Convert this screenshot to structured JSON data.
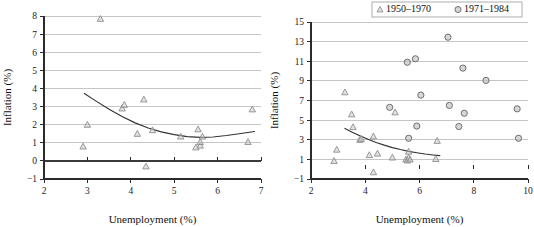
{
  "figure": {
    "panel_count": 2
  },
  "chart_data": [
    {
      "id": "left",
      "type": "scatter",
      "title": "",
      "xlabel": "Unemployment (%)",
      "ylabel": "Inflation (%)",
      "xlim": [
        2,
        7
      ],
      "ylim": [
        -1,
        8
      ],
      "xticks": [
        2,
        3,
        4,
        5,
        6,
        7
      ],
      "yticks": [
        -1,
        0,
        1,
        2,
        3,
        4,
        5,
        6,
        7,
        8
      ],
      "grid": true,
      "legend": false,
      "series": [
        {
          "name": "1950-1970",
          "marker": "triangle",
          "points": [
            [
              2.9,
              0.8
            ],
            [
              3.0,
              2.0
            ],
            [
              3.3,
              7.85
            ],
            [
              3.8,
              2.9
            ],
            [
              3.85,
              3.1
            ],
            [
              4.15,
              1.5
            ],
            [
              4.3,
              3.4
            ],
            [
              4.35,
              -0.3
            ],
            [
              4.5,
              1.7
            ],
            [
              5.15,
              1.35
            ],
            [
              5.5,
              0.75
            ],
            [
              5.55,
              1.75
            ],
            [
              5.6,
              0.85
            ],
            [
              5.6,
              1.05
            ],
            [
              5.65,
              1.35
            ],
            [
              6.7,
              1.05
            ],
            [
              6.8,
              2.85
            ]
          ]
        }
      ],
      "trend": {
        "name": "quadratic-fit",
        "points": [
          [
            2.93,
            3.72
          ],
          [
            3.2,
            3.3
          ],
          [
            3.5,
            2.85
          ],
          [
            3.8,
            2.45
          ],
          [
            4.1,
            2.1
          ],
          [
            4.4,
            1.82
          ],
          [
            4.7,
            1.6
          ],
          [
            5.0,
            1.45
          ],
          [
            5.3,
            1.34
          ],
          [
            5.6,
            1.3
          ],
          [
            5.9,
            1.32
          ],
          [
            6.2,
            1.4
          ],
          [
            6.5,
            1.5
          ],
          [
            6.85,
            1.62
          ]
        ]
      }
    },
    {
      "id": "right",
      "type": "scatter",
      "title": "",
      "xlabel": "Unemployment (%)",
      "ylabel": "Inflation (%)",
      "xlim": [
        2,
        10
      ],
      "ylim": [
        -1,
        15
      ],
      "xticks": [
        2,
        4,
        6,
        8,
        10
      ],
      "yticks": [
        -1,
        1,
        3,
        5,
        7,
        9,
        11,
        13,
        15
      ],
      "grid": true,
      "legend": true,
      "legend_position": "top",
      "legend_entries": [
        {
          "label": "1950-1970",
          "marker": "triangle"
        },
        {
          "label": "1971-1984",
          "marker": "circle"
        }
      ],
      "series": [
        {
          "name": "1950-1970",
          "marker": "triangle",
          "points": [
            [
              2.85,
              0.85
            ],
            [
              2.95,
              2.0
            ],
            [
              3.25,
              7.85
            ],
            [
              3.5,
              5.6
            ],
            [
              3.55,
              4.3
            ],
            [
              3.8,
              3.0
            ],
            [
              3.85,
              3.1
            ],
            [
              4.15,
              1.45
            ],
            [
              4.3,
              3.35
            ],
            [
              4.3,
              -0.3
            ],
            [
              4.45,
              1.6
            ],
            [
              5.0,
              1.2
            ],
            [
              5.1,
              5.8
            ],
            [
              5.5,
              1.0
            ],
            [
              5.55,
              0.9
            ],
            [
              5.6,
              1.2
            ],
            [
              5.6,
              1.8
            ],
            [
              5.65,
              1.0
            ],
            [
              6.6,
              1.05
            ],
            [
              6.65,
              2.9
            ]
          ]
        },
        {
          "name": "1971-1984",
          "marker": "circle",
          "points": [
            [
              4.9,
              6.3
            ],
            [
              5.55,
              10.9
            ],
            [
              5.6,
              3.15
            ],
            [
              5.85,
              11.25
            ],
            [
              5.9,
              4.4
            ],
            [
              6.05,
              7.55
            ],
            [
              7.05,
              13.45
            ],
            [
              7.1,
              6.5
            ],
            [
              7.45,
              4.35
            ],
            [
              7.6,
              10.3
            ],
            [
              7.65,
              5.7
            ],
            [
              8.45,
              9.05
            ],
            [
              9.6,
              6.15
            ],
            [
              9.65,
              3.15
            ]
          ]
        }
      ],
      "trend": {
        "name": "decay-fit",
        "points": [
          [
            3.25,
            4.15
          ],
          [
            3.5,
            3.8
          ],
          [
            3.8,
            3.4
          ],
          [
            4.1,
            3.05
          ],
          [
            4.4,
            2.72
          ],
          [
            4.7,
            2.45
          ],
          [
            5.0,
            2.2
          ],
          [
            5.3,
            2.0
          ],
          [
            5.6,
            1.82
          ],
          [
            5.9,
            1.68
          ],
          [
            6.2,
            1.55
          ],
          [
            6.5,
            1.45
          ],
          [
            6.75,
            1.38
          ]
        ]
      }
    }
  ]
}
